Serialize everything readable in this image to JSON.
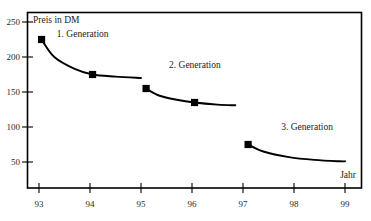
{
  "chart_data": {
    "type": "line",
    "title": "",
    "xlabel": "Jahr",
    "ylabel": "Preis in DM",
    "xlim": [
      93,
      99
    ],
    "ylim": [
      0,
      260
    ],
    "grid": false,
    "legend_position": "inline-annotations",
    "x_ticks": [
      "93",
      "94",
      "95",
      "96",
      "97",
      "98",
      "99"
    ],
    "y_ticks": [
      "250",
      "200",
      "150",
      "100",
      "50"
    ],
    "series": [
      {
        "name": "1. Generation",
        "x": [
          93.05,
          93.3,
          93.7,
          94.05,
          94.5,
          95.0
        ],
        "values": [
          225,
          200,
          183,
          175,
          172,
          170
        ],
        "markers": [
          {
            "x": 93.05,
            "y": 225
          },
          {
            "x": 94.05,
            "y": 175
          }
        ]
      },
      {
        "name": "2. Generation",
        "x": [
          95.1,
          95.35,
          95.7,
          96.05,
          96.5,
          96.85
        ],
        "values": [
          155,
          145,
          139,
          135,
          132,
          131
        ],
        "markers": [
          {
            "x": 95.1,
            "y": 155
          },
          {
            "x": 96.05,
            "y": 135
          }
        ]
      },
      {
        "name": "3. Generation",
        "x": [
          97.1,
          97.4,
          97.9,
          98.4,
          98.9,
          99.0
        ],
        "values": [
          75,
          65,
          57,
          53,
          51,
          51
        ],
        "markers": [
          {
            "x": 97.1,
            "y": 75
          }
        ]
      }
    ],
    "annotations": [
      {
        "text": "1. Generation",
        "x": 93.35,
        "y": 228
      },
      {
        "text": "2. Generation",
        "x": 95.55,
        "y": 185
      },
      {
        "text": "3. Generation",
        "x": 97.75,
        "y": 96
      }
    ],
    "colors": {
      "line": "#000000",
      "marker": "#000000",
      "axis": "#000000",
      "background": "#ffffff"
    }
  }
}
